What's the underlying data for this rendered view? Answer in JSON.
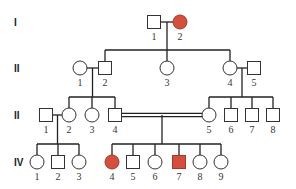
{
  "colors": {
    "affected": "#d4503e",
    "unaffected": "#ffffff",
    "line": "#222222"
  },
  "generations": [
    {
      "label": "I",
      "y": 22
    },
    {
      "label": "II",
      "y": 68
    },
    {
      "label": "II",
      "y": 115
    },
    {
      "label": "IV",
      "y": 162
    }
  ],
  "individuals": [
    {
      "id": "I-1",
      "gen": 0,
      "num": "1",
      "sex": "male",
      "affected": false,
      "x": 154
    },
    {
      "id": "I-2",
      "gen": 0,
      "num": "2",
      "sex": "female",
      "affected": true,
      "x": 180
    },
    {
      "id": "II-1",
      "gen": 1,
      "num": "1",
      "sex": "female",
      "affected": false,
      "x": 80
    },
    {
      "id": "II-2",
      "gen": 1,
      "num": "2",
      "sex": "male",
      "affected": false,
      "x": 105
    },
    {
      "id": "II-3",
      "gen": 1,
      "num": "3",
      "sex": "female",
      "affected": false,
      "x": 167
    },
    {
      "id": "II-4",
      "gen": 1,
      "num": "4",
      "sex": "female",
      "affected": false,
      "x": 230
    },
    {
      "id": "II-5",
      "gen": 1,
      "num": "5",
      "sex": "male",
      "affected": false,
      "x": 254
    },
    {
      "id": "III-1",
      "gen": 2,
      "num": "1",
      "sex": "male",
      "affected": false,
      "x": 46
    },
    {
      "id": "III-2",
      "gen": 2,
      "num": "2",
      "sex": "female",
      "affected": false,
      "x": 69
    },
    {
      "id": "III-3",
      "gen": 2,
      "num": "3",
      "sex": "female",
      "affected": false,
      "x": 92
    },
    {
      "id": "III-4",
      "gen": 2,
      "num": "4",
      "sex": "male",
      "affected": false,
      "x": 115
    },
    {
      "id": "III-5",
      "gen": 2,
      "num": "5",
      "sex": "female",
      "affected": false,
      "x": 209
    },
    {
      "id": "III-6",
      "gen": 2,
      "num": "6",
      "sex": "male",
      "affected": false,
      "x": 231
    },
    {
      "id": "III-7",
      "gen": 2,
      "num": "7",
      "sex": "male",
      "affected": false,
      "x": 252
    },
    {
      "id": "III-8",
      "gen": 2,
      "num": "8",
      "sex": "male",
      "affected": false,
      "x": 273
    },
    {
      "id": "IV-1",
      "gen": 3,
      "num": "1",
      "sex": "female",
      "affected": false,
      "x": 37
    },
    {
      "id": "IV-2",
      "gen": 3,
      "num": "2",
      "sex": "male",
      "affected": false,
      "x": 58
    },
    {
      "id": "IV-3",
      "gen": 3,
      "num": "3",
      "sex": "female",
      "affected": false,
      "x": 79
    },
    {
      "id": "IV-4",
      "gen": 3,
      "num": "4",
      "sex": "female",
      "affected": true,
      "x": 112
    },
    {
      "id": "IV-5",
      "gen": 3,
      "num": "5",
      "sex": "male",
      "affected": false,
      "x": 133
    },
    {
      "id": "IV-6",
      "gen": 3,
      "num": "6",
      "sex": "female",
      "affected": false,
      "x": 155
    },
    {
      "id": "IV-7",
      "gen": 3,
      "num": "7",
      "sex": "male",
      "affected": true,
      "x": 179
    },
    {
      "id": "IV-8",
      "gen": 3,
      "num": "8",
      "sex": "female",
      "affected": false,
      "x": 200
    },
    {
      "id": "IV-9",
      "gen": 3,
      "num": "9",
      "sex": "female",
      "affected": false,
      "x": 221
    }
  ],
  "matings": [
    {
      "a": "I-1",
      "b": "I-2",
      "consanguineous": false,
      "children": [
        "II-2",
        "II-3",
        "II-4"
      ]
    },
    {
      "a": "II-1",
      "b": "II-2",
      "consanguineous": false,
      "children": [
        "III-2",
        "III-3",
        "III-4"
      ]
    },
    {
      "a": "II-4",
      "b": "II-5",
      "consanguineous": false,
      "children": [
        "III-5",
        "III-6",
        "III-7",
        "III-8"
      ]
    },
    {
      "a": "III-1",
      "b": "III-2",
      "consanguineous": false,
      "children": [
        "IV-1",
        "IV-2",
        "IV-3"
      ]
    },
    {
      "a": "III-4",
      "b": "III-5",
      "consanguineous": true,
      "children": [
        "IV-4",
        "IV-5",
        "IV-6",
        "IV-7",
        "IV-8",
        "IV-9"
      ]
    }
  ]
}
